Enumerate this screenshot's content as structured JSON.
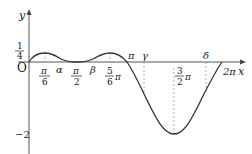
{
  "figure": {
    "type": "function-graph",
    "axis_labels": {
      "x": "x",
      "y": "y",
      "origin": "O"
    },
    "y_ticks": [
      {
        "label_num": "1",
        "label_den": "4",
        "value": 0.25
      },
      {
        "label": "−2",
        "value": -2
      }
    ],
    "x_ticks": [
      {
        "label_num": "π",
        "label_den": "6",
        "value": "π/6"
      },
      {
        "label": "α",
        "value": "α"
      },
      {
        "label_num": "π",
        "label_den": "2",
        "value": "π/2"
      },
      {
        "label": "β",
        "value": "β"
      },
      {
        "label_num": "5",
        "label_den": "6",
        "suffix": "π",
        "value": "5π/6"
      },
      {
        "label": "π",
        "value": "π"
      },
      {
        "label": "γ",
        "value": "γ"
      },
      {
        "label_num": "3",
        "label_den": "2",
        "suffix": "π",
        "value": "3π/2"
      },
      {
        "label": "δ",
        "value": "δ"
      },
      {
        "label": "2π",
        "value": "2π"
      }
    ],
    "curve": {
      "description": "Curve starts at O, peaks at 1/4 at π/6 and 5π/6, touches 0 at π/2, crosses zero at π, minimum −2 at 3π/2, returns to 0 at 2π",
      "key_points": [
        {
          "x": "0",
          "y": 0
        },
        {
          "x": "π/6",
          "y": 0.25
        },
        {
          "x": "π/2",
          "y": 0
        },
        {
          "x": "5π/6",
          "y": 0.25
        },
        {
          "x": "π",
          "y": 0
        },
        {
          "x": "3π/2",
          "y": -2
        },
        {
          "x": "2π",
          "y": 0
        }
      ]
    },
    "colors": {
      "curve": "#333333",
      "axes": "#444444",
      "dashed": "#999999"
    }
  }
}
